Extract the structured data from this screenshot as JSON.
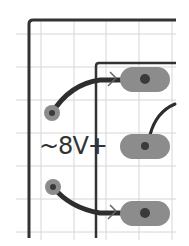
{
  "diagram": {
    "type": "pcb-layout-fragment",
    "label": "~8V+",
    "colors": {
      "background": "#ffffff",
      "grid": "#d6d6d6",
      "frame": "#333333",
      "pad": "#8c8c8c",
      "pad_hole": "#3a3a3a",
      "trace": "#2e2e2e"
    },
    "grid": {
      "x": [
        16,
        41,
        74,
        106,
        139,
        172
      ],
      "y": [
        34,
        67,
        100,
        133,
        166,
        199,
        232
      ]
    },
    "pads": [
      {
        "name": "pad-top",
        "cx": 145,
        "cy": 79,
        "w": 50,
        "h": 25
      },
      {
        "name": "pad-middle",
        "cx": 145,
        "cy": 146,
        "w": 50,
        "h": 25
      },
      {
        "name": "pad-bottom",
        "cx": 145,
        "cy": 213,
        "w": 50,
        "h": 25
      }
    ],
    "vias": [
      {
        "name": "via-upper",
        "cx": 52,
        "cy": 113,
        "r": 8
      },
      {
        "name": "via-lower",
        "cx": 53,
        "cy": 187,
        "r": 8
      }
    ]
  }
}
